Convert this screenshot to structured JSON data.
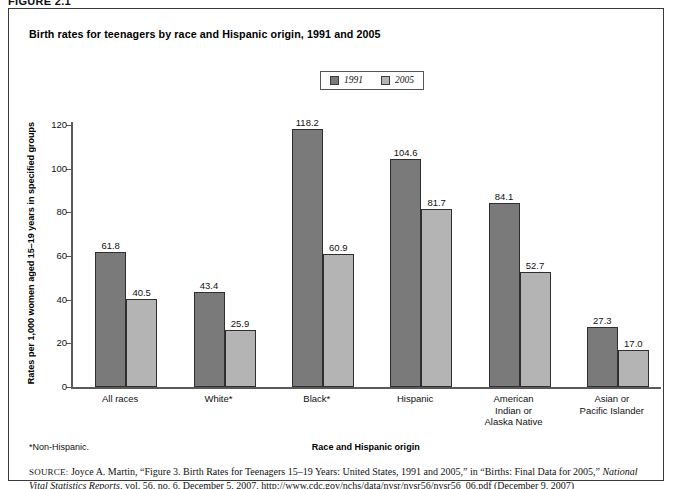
{
  "figure": {
    "number": "FIGURE 2.1",
    "title": "Birth rates for teenagers by race and Hispanic origin, 1991 and 2005",
    "footnote": "*Non-Hispanic.",
    "source": {
      "label": "SOURCE:",
      "text_part1": " Joyce A. Martin, “Figure 3. Birth Rates for Teenagers 15–19 Years: United States, 1991 and 2005,” in “Births: Final Data for 2005,” ",
      "italic1": "National Vital Statistics Reports",
      "text_part2": ", vol. 56, no. 6, December 5, 2007, http://www.cdc.gov/nchs/data/nvsr/nvsr56/nvsr56_06.pdf (December 9, 2007)"
    }
  },
  "colors": {
    "series_1991": "#7a7a7a",
    "series_2005": "#b4b4b4",
    "axis": "#5a5a5a",
    "bar_outline": "#2f2f2f",
    "frame": "#3a3a3a"
  },
  "chart_data": {
    "type": "bar",
    "title": "Birth rates for teenagers by race and Hispanic origin, 1991 and 2005",
    "xlabel": "Race and Hispanic origin",
    "ylabel": "Rates per 1,000 women aged 15–19 years in specified groups",
    "ylim": [
      0,
      120
    ],
    "yticks": [
      0,
      20,
      40,
      60,
      80,
      100,
      120
    ],
    "ytick_labels": [
      "0",
      "20",
      "40",
      "60",
      "80",
      "100",
      "120"
    ],
    "grid": false,
    "legend_position": "top-center",
    "categories": [
      "All races",
      "White*",
      "Black*",
      "Hispanic",
      "American Indian or Alaska Native",
      "Asian or Pacific Islander"
    ],
    "category_lines": [
      [
        "All races"
      ],
      [
        "White*"
      ],
      [
        "Black*"
      ],
      [
        "Hispanic"
      ],
      [
        "American",
        "Indian or",
        "Alaska Native"
      ],
      [
        "Asian or",
        "Pacific Islander"
      ]
    ],
    "series": [
      {
        "name": "1991",
        "color": "#7a7a7a",
        "values": [
          61.8,
          43.4,
          118.2,
          104.6,
          84.1,
          27.3
        ],
        "value_labels": [
          "61.8",
          "43.4",
          "118.2",
          "104.6",
          "84.1",
          "27.3"
        ]
      },
      {
        "name": "2005",
        "color": "#b4b4b4",
        "values": [
          40.5,
          25.9,
          60.9,
          81.7,
          52.7,
          17.0
        ],
        "value_labels": [
          "40.5",
          "25.9",
          "60.9",
          "81.7",
          "52.7",
          "17.0"
        ]
      }
    ]
  }
}
